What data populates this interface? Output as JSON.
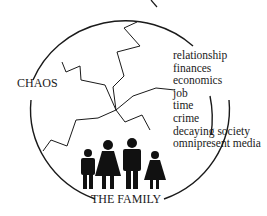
{
  "labels": {
    "chaos": "CHAOS",
    "family": "THE FAMILY"
  },
  "factors": [
    "relationship",
    "finances",
    "economics",
    "job",
    "time",
    "crime",
    "decaying society",
    "omnipresent media"
  ],
  "colors": {
    "ink": "#1a1a1a",
    "background": "#ffffff"
  }
}
